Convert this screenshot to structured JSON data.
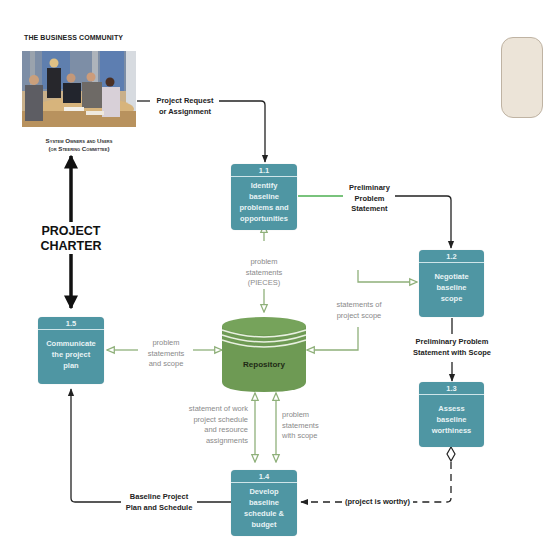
{
  "diagram": {
    "type": "data-flow-diagram",
    "external_entity": {
      "heading": "THE BUSINESS COMMUNITY",
      "photo": "business-meeting-photo",
      "caption_line1": "System Owners and Users",
      "caption_line2": "(or Steering Committee)"
    },
    "project_charter": {
      "line1": "PROJECT",
      "line2": "CHARTER"
    },
    "processes": [
      {
        "id": "1.1",
        "line1": "Identify",
        "line2": "baseline",
        "line3": "problems and",
        "line4": "opportunities"
      },
      {
        "id": "1.2",
        "line1": "Negotiate",
        "line2": "baseline",
        "line3": "scope",
        "line4": ""
      },
      {
        "id": "1.3",
        "line1": "Assess",
        "line2": "baseline",
        "line3": "worthiness",
        "line4": ""
      },
      {
        "id": "1.4",
        "line1": "Develop",
        "line2": "baseline",
        "line3": "schedule &",
        "line4": "budget"
      },
      {
        "id": "1.5",
        "line1": "Communicate",
        "line2": "the project",
        "line3": "plan",
        "line4": ""
      }
    ],
    "data_store": {
      "label": "Repository"
    },
    "flows": {
      "request": {
        "line1": "Project Request",
        "line2": "or Assignment"
      },
      "prelim": {
        "line1": "Preliminary",
        "line2": "Problem",
        "line3": "Statement"
      },
      "prelim_scope": {
        "line1": "Preliminary Problem",
        "line2": "Statement with Scope"
      },
      "pieces": {
        "line1": "problem",
        "line2": "statements",
        "line3": "(PIECES)"
      },
      "scope_stmt": {
        "line1": "statements of",
        "line2": "project scope"
      },
      "prob_scope": {
        "line1": "problem",
        "line2": "statements",
        "line3": "and scope"
      },
      "sow": {
        "line1": "statement of work",
        "line2": "project schedule",
        "line3": "and resource",
        "line4": "assignments"
      },
      "prob_with_scope": {
        "line1": "problem",
        "line2": "statements",
        "line3": "with scope"
      },
      "baseline_plan": {
        "line1": "Baseline Project",
        "line2": "Plan and Schedule"
      },
      "worthy": {
        "label": "(project is worthy)"
      }
    },
    "colors": {
      "process": "#4f96a3",
      "repository": "#6e9a54",
      "data_flow_green": "#8fb07a",
      "control_flow": "#222222",
      "note_fill": "#ece4d8"
    }
  }
}
